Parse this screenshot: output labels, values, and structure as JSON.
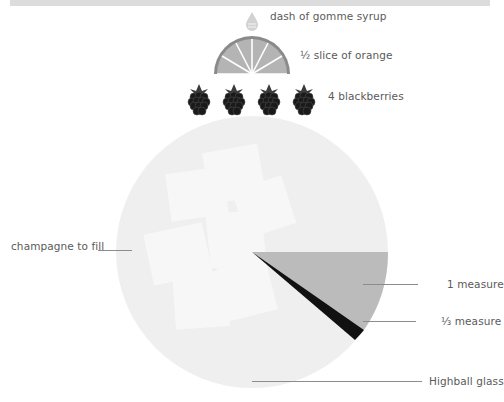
{
  "glass": {
    "name": "Highball glass"
  },
  "garnishes": [
    {
      "icon": "syrup-drop-icon",
      "label": "dash of gomme syrup"
    },
    {
      "icon": "orange-slice-icon",
      "label": "½ slice of orange"
    },
    {
      "icon": "blackberry-icon",
      "count": 4,
      "label": "4 blackberries"
    }
  ],
  "ingredients": [
    {
      "label": "champagne to fill",
      "color": "#f0f0f0"
    },
    {
      "label": "1 measure",
      "color": "#b4b4b4"
    },
    {
      "label": "⅓ measure",
      "color": "#111111"
    }
  ],
  "colors": {
    "glass": "#efefef",
    "ice": "#f8f8f8",
    "orange": "#b0b0b0",
    "orange_rind": "#8a8a8a",
    "blackberry": "#1a1a1a",
    "drop": "#d0d0d0"
  }
}
